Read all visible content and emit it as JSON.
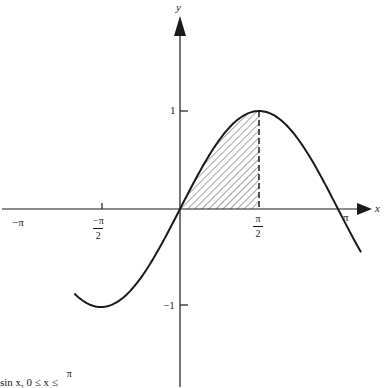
{
  "figure": {
    "axes": {
      "x_label": "x",
      "y_label": "y",
      "x_ticks": [
        {
          "label": "−π"
        },
        {
          "label_num": "−π",
          "label_den": "2"
        },
        {
          "label_num": "π",
          "label_den": "2"
        },
        {
          "label": "π"
        }
      ],
      "y_ticks": [
        {
          "label": "1"
        },
        {
          "label": "−1"
        }
      ]
    },
    "caption": {
      "text": "sin x, 0 ≤ x ≤",
      "frac_num": "π"
    }
  },
  "chart_data": {
    "type": "line",
    "title": "",
    "xlabel": "x",
    "ylabel": "y",
    "function": "y = sin x",
    "x_range": [
      -2.1,
      3.6
    ],
    "y_range": [
      -1,
      1
    ],
    "xticks": [
      "−π",
      "−π/2",
      "π/2",
      "π"
    ],
    "yticks": [
      "1",
      "−1"
    ],
    "shaded_region": {
      "from": 0,
      "to": "π/2",
      "under": "sin x",
      "style": "diagonal hatching",
      "right_boundary": "dashed vertical line at x = π/2"
    },
    "points": [
      {
        "x": -1.5708,
        "y": -1
      },
      {
        "x": 0,
        "y": 0
      },
      {
        "x": 1.5708,
        "y": 1
      },
      {
        "x": 3.1416,
        "y": 0
      }
    ],
    "grid": false,
    "legend": null
  }
}
